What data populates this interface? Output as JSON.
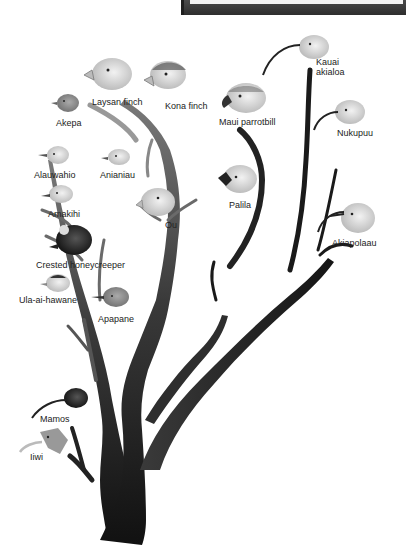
{
  "figure": {
    "colors": {
      "trunk_dark": "#151515",
      "branch_mid": "#6a6a6a",
      "branch_light": "#9a9a9a",
      "label": "#222222"
    }
  },
  "labels": {
    "laysan_finch": "Laysan finch",
    "kona_finch": "Kona finch",
    "akepa": "Akepa",
    "maui_parrotbill": "Maui parrotbill",
    "kauai_akialoa_1": "Kauai",
    "kauai_akialoa_2": "akialoa",
    "nukupuu": "Nukupuu",
    "alauwahio": "Alauwahio",
    "anianiau": "Anianiau",
    "amakihi": "Amakihi",
    "ou": "Ou",
    "palila": "Palila",
    "akiapolaau": "Akiapolaau",
    "crested_honeycreeper": "Crested honeycreeper",
    "ula_ai_hawane": "Ula-ai-hawane",
    "apapane": "Apapane",
    "mamos": "Mamos",
    "iiwi": "Iiwi"
  }
}
